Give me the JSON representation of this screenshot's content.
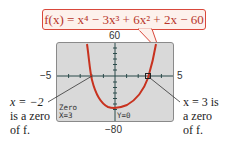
{
  "callout": {
    "formula": "f(x) = x⁴ − 3x³ + 6x² + 2x − 60"
  },
  "window": {
    "ymax_label": "60",
    "ymin_label": "−80",
    "xmin_label": "−5",
    "xmax_label": "5"
  },
  "screen": {
    "mode_label": "Zero",
    "x_readout": "X=3",
    "y_readout": "Y=0"
  },
  "annotations": {
    "left": {
      "line1": "x = −2",
      "line2": "is a zero",
      "line3": "of f."
    },
    "right": {
      "line1": "x = 3 is",
      "line2": "a zero",
      "line3": "of f."
    }
  },
  "colors": {
    "curve": "#c8321f",
    "axis": "#2b4a4a",
    "callout_border": "#d9483b"
  }
}
